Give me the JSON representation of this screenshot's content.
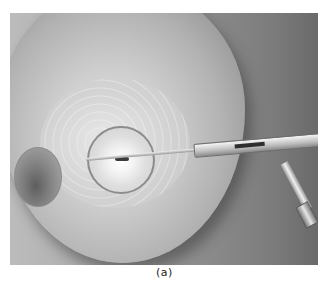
{
  "figure": {
    "caption": "(a)",
    "elements": [
      "breast",
      "nipple",
      "glandular-tissue",
      "ablation-zone",
      "tumor",
      "probe-shaft",
      "probe-handle",
      "probe-tube",
      "probe-connector"
    ]
  }
}
